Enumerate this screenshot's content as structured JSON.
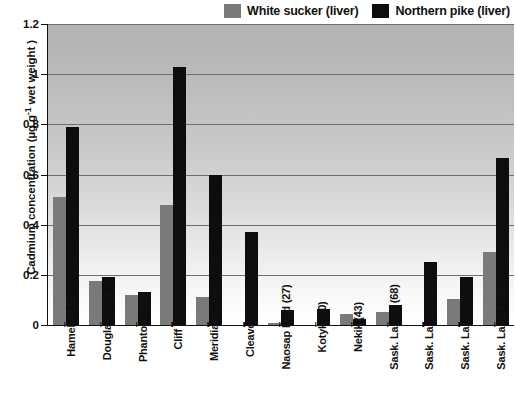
{
  "chart_data": {
    "type": "bar",
    "title": "",
    "xlabel": "",
    "ylabel": "Cadmium concentration (µg.g",
    "ylabel_sup": "-1",
    "ylabel_tail": " wet weight )",
    "ylim": [
      0,
      1.2
    ],
    "ytick_labels": [
      "1.2",
      "1",
      "0.8",
      "0.6",
      "0.4",
      "0.2",
      "0"
    ],
    "ytick_values": [
      1.2,
      1.0,
      0.8,
      0.6,
      0.4,
      0.2,
      0
    ],
    "grid": true,
    "legend_position": "top-right",
    "categories": [
      "Hamell (4.5)",
      "Douglas (5.0)",
      "Phantom (5.4)",
      "Cliff (5.6)",
      "Meridian (7.6)",
      "Cleaver (23)",
      "Naosap Mud (27)",
      "Kotyk (30)",
      "Nekik (43)",
      "Sask. Lake 1 (68)",
      "Sask. Lake 2 (74)",
      "Sask. Lake 3 (83)",
      "Sask. Lake 4 (84)"
    ],
    "series": [
      {
        "name": "White sucker (liver)",
        "color": "#7a7a7a",
        "values": [
          0.51,
          0.175,
          0.12,
          0.48,
          0.11,
          0.0,
          0.01,
          0.0,
          0.045,
          0.05,
          0.0,
          0.105,
          0.29
        ]
      },
      {
        "name": "Northern pike (liver)",
        "color": "#0d0d0d",
        "values": [
          0.79,
          0.19,
          0.13,
          1.03,
          0.6,
          0.37,
          0.06,
          0.065,
          0.025,
          0.08,
          0.25,
          0.19,
          0.665
        ]
      }
    ]
  },
  "legend": {
    "items": [
      {
        "label": "White sucker (liver)",
        "color": "#7a7a7a"
      },
      {
        "label": "Northern pike (liver)",
        "color": "#0d0d0d"
      }
    ]
  }
}
